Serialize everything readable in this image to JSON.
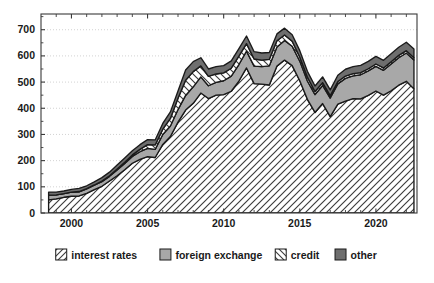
{
  "chart_data": {
    "type": "area",
    "title": "",
    "xlabel": "",
    "ylabel": "",
    "stacked": true,
    "grid": true,
    "grid_axis": "y",
    "legend_position": "bottom",
    "xlim": [
      1998.0,
      2022.7
    ],
    "ylim": [
      0,
      760
    ],
    "yticks": [
      0,
      100,
      200,
      300,
      400,
      500,
      600,
      700
    ],
    "ytick_labels": [
      "0",
      "100",
      "200",
      "300",
      "400",
      "500",
      "600",
      "700"
    ],
    "xticks": [
      1999,
      2000,
      2001,
      2002,
      2003,
      2004,
      2005,
      2006,
      2007,
      2008,
      2009,
      2010,
      2011,
      2012,
      2013,
      2014,
      2015,
      2016,
      2017,
      2018,
      2019,
      2020,
      2021,
      2022
    ],
    "xtick_labels_shown": [
      "2000",
      "2005",
      "2010",
      "2015",
      "2020"
    ],
    "xtick_labeled_values": [
      2000,
      2005,
      2010,
      2015,
      2020
    ],
    "x": [
      1998.5,
      1999.0,
      1999.5,
      2000.0,
      2000.5,
      2001.0,
      2001.5,
      2002.0,
      2002.5,
      2003.0,
      2003.5,
      2004.0,
      2004.5,
      2005.0,
      2005.5,
      2006.0,
      2006.5,
      2007.0,
      2007.5,
      2008.0,
      2008.5,
      2009.0,
      2009.5,
      2010.0,
      2010.5,
      2011.0,
      2011.5,
      2012.0,
      2012.5,
      2013.0,
      2013.5,
      2014.0,
      2014.5,
      2015.0,
      2015.5,
      2016.0,
      2016.5,
      2017.0,
      2017.5,
      2018.0,
      2018.5,
      2019.0,
      2019.5,
      2020.0,
      2020.5,
      2021.0,
      2021.5,
      2022.0,
      2022.5
    ],
    "series": [
      {
        "name": "interest rates",
        "pattern": "forward-hatch",
        "values": [
          50,
          54,
          60,
          64,
          65,
          75,
          89,
          102,
          122,
          142,
          165,
          190,
          205,
          215,
          212,
          262,
          292,
          347,
          393,
          419,
          458,
          437,
          450,
          452,
          465,
          504,
          554,
          494,
          492,
          489,
          561,
          584,
          563,
          505,
          434,
          384,
          418,
          368,
          416,
          427,
          437,
          436,
          449,
          466,
          450,
          467,
          488,
          503,
          474
        ]
      },
      {
        "name": "foreign exchange",
        "pattern": "solid-light-gray",
        "values": [
          18,
          15,
          14,
          16,
          16,
          17,
          17,
          18,
          18,
          22,
          24,
          26,
          29,
          32,
          31,
          38,
          40,
          48,
          56,
          63,
          62,
          49,
          49,
          53,
          58,
          63,
          64,
          67,
          67,
          73,
          73,
          75,
          74,
          75,
          70,
          68,
          69,
          71,
          77,
          87,
          87,
          92,
          94,
          94,
          95,
          102,
          105,
          108,
          110
        ]
      },
      {
        "name": "credit",
        "pattern": "back-hatch",
        "values": [
          0,
          0,
          0,
          0,
          1,
          1,
          1,
          2,
          2,
          4,
          5,
          6,
          9,
          14,
          17,
          20,
          29,
          43,
          58,
          58,
          42,
          36,
          32,
          30,
          30,
          32,
          29,
          27,
          25,
          25,
          24,
          21,
          19,
          16,
          15,
          12,
          11,
          9,
          9,
          9,
          8,
          8,
          8,
          9,
          9,
          9,
          9,
          9,
          9
        ]
      },
      {
        "name": "other",
        "pattern": "solid-dark-gray",
        "values": [
          12,
          11,
          10,
          10,
          12,
          11,
          12,
          13,
          14,
          15,
          16,
          16,
          18,
          19,
          19,
          22,
          25,
          28,
          39,
          38,
          31,
          28,
          28,
          28,
          28,
          29,
          29,
          28,
          27,
          26,
          26,
          26,
          25,
          24,
          22,
          21,
          22,
          22,
          24,
          26,
          27,
          28,
          28,
          29,
          29,
          30,
          31,
          32,
          33
        ]
      }
    ]
  },
  "legend": {
    "items": [
      {
        "label": "interest rates",
        "swatch": "forward-hatch-swatch"
      },
      {
        "label": "foreign exchange",
        "swatch": "light-gray-swatch"
      },
      {
        "label": "credit",
        "swatch": "back-hatch-swatch"
      },
      {
        "label": "other",
        "swatch": "dark-gray-swatch"
      }
    ]
  },
  "colors": {
    "interest_rates": "#ffffff",
    "foreign_exchange": "#a8a8a8",
    "credit": "#ffffff",
    "other": "#6e6e6e",
    "hatch": "#3c3c3c",
    "outline": "#1a1a1a",
    "grid": "#c8c8c8",
    "axis": "#3a3a3a",
    "text": "#1a1a1a",
    "background": "#ffffff"
  }
}
